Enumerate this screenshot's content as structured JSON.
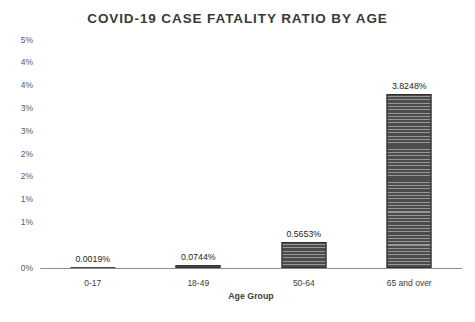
{
  "chart_data": {
    "type": "bar",
    "title": "COVID-19 CASE FATALITY RATIO BY AGE",
    "xlabel": "Age Group",
    "ylabel": "",
    "categories": [
      "0-17",
      "18-49",
      "50-64",
      "65 and over"
    ],
    "values": [
      0.0019,
      0.0744,
      0.5653,
      3.8248
    ],
    "value_labels": [
      "0.0019%",
      "0.0744%",
      "0.5653%",
      "3.8248%"
    ],
    "ylim": [
      0,
      5
    ],
    "ytick_values": [
      0,
      0.5,
      1.0,
      1.5,
      2.0,
      2.5,
      3.0,
      3.5,
      4.0,
      4.5,
      5.0
    ],
    "ytick_labels": [
      "0%",
      "1%",
      "1%",
      "2%",
      "2%",
      "3%",
      "3%",
      "4%",
      "4%",
      "5%"
    ],
    "ytick_labels_top_to_bottom": [
      "5%",
      "4%",
      "4%",
      "3%",
      "3%",
      "2%",
      "2%",
      "1%",
      "1%",
      "0%"
    ],
    "grid": false,
    "legend": false,
    "units": "percent",
    "series_color": "#4c4c4c",
    "bar_pattern": "horizontal-stripes"
  },
  "axis": {
    "y_ticks": [
      {
        "label": "5%",
        "value": 5.0
      },
      {
        "label": "4%",
        "value": 4.5
      },
      {
        "label": "4%",
        "value": 4.0
      },
      {
        "label": "3%",
        "value": 3.5
      },
      {
        "label": "3%",
        "value": 3.0
      },
      {
        "label": "2%",
        "value": 2.5
      },
      {
        "label": "2%",
        "value": 2.0
      },
      {
        "label": "1%",
        "value": 1.5
      },
      {
        "label": "1%",
        "value": 1.0
      },
      {
        "label": "0%",
        "value": 0.0
      }
    ]
  }
}
